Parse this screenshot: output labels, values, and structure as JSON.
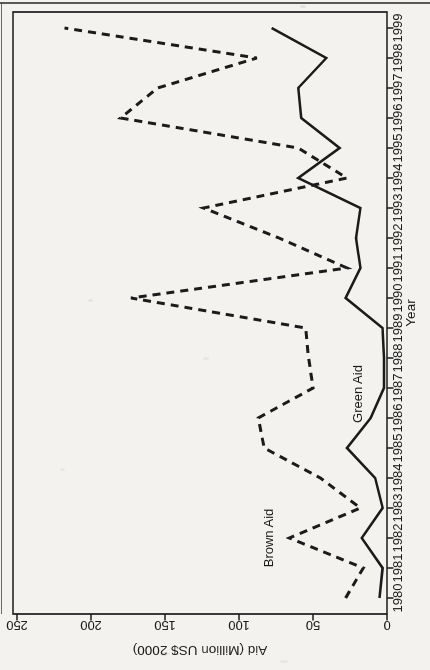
{
  "page": {
    "background": "#f3f2ef",
    "ink_color": "#1b1b1b"
  },
  "chart_data": {
    "type": "line",
    "title": "",
    "xlabel": "Year",
    "ylabel": "Aid (Million US$ 2000)",
    "categories": [
      "1980",
      "1981",
      "1982",
      "1983",
      "1984",
      "1985",
      "1986",
      "1987",
      "1988",
      "1989",
      "1990",
      "1991",
      "1992",
      "1993",
      "1994",
      "1995",
      "1996",
      "1997",
      "1998",
      "1999"
    ],
    "ylim": [
      0,
      250
    ],
    "yticks": [
      "0",
      "50",
      "100",
      "150",
      "200",
      "250"
    ],
    "grid": false,
    "legend": "in-plot text annotations",
    "rotation_degrees": -90,
    "line_color": "#1b1b1b",
    "series": [
      {
        "name": "Green Aid",
        "style": "solid",
        "values": [
          5,
          3,
          17,
          3,
          8,
          27,
          11,
          2,
          2,
          3,
          28,
          18,
          21,
          18,
          60,
          32,
          58,
          60,
          41,
          78
        ]
      },
      {
        "name": "Brown Aid",
        "style": "dashed",
        "values": [
          28,
          16,
          66,
          18,
          45,
          83,
          87,
          50,
          53,
          55,
          173,
          27,
          73,
          124,
          27,
          60,
          180,
          155,
          88,
          218
        ]
      }
    ],
    "annotations": [
      {
        "text": "Brown Aid",
        "x": "1982",
        "y": 80
      },
      {
        "text": "Green Aid",
        "x": "1986.8",
        "y": 20
      }
    ]
  }
}
